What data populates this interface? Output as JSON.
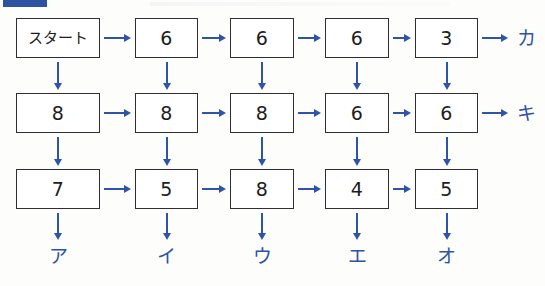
{
  "diagram": {
    "title_fragment_visible": false,
    "accent_color": "#2e53a8",
    "box_border_color": "#2f2f33",
    "background_color": "#fdfdfc",
    "columns": 5,
    "rows": 3,
    "rows_data": [
      {
        "row_index": 0,
        "cells": [
          "スタート",
          "6",
          "6",
          "6",
          "3"
        ],
        "end_label": "カ"
      },
      {
        "row_index": 1,
        "cells": [
          "8",
          "8",
          "8",
          "6",
          "6"
        ],
        "end_label": "キ"
      },
      {
        "row_index": 2,
        "cells": [
          "7",
          "5",
          "8",
          "4",
          "5"
        ],
        "end_label": ""
      }
    ],
    "bottom_labels": [
      "ア",
      "イ",
      "ウ",
      "エ",
      "オ"
    ],
    "horizontal_arrow_icon": "arrow-right-icon",
    "vertical_arrow_icon": "arrow-down-icon"
  }
}
